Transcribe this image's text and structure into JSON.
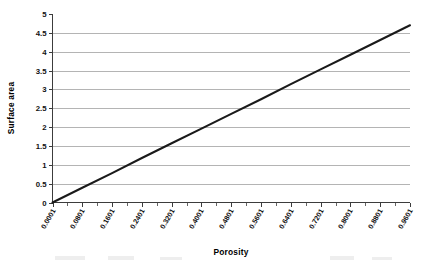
{
  "chart_data": {
    "type": "line",
    "title": "",
    "xlabel": "Porosity",
    "ylabel": "Surface area",
    "xlim": [
      0.0001,
      0.9601
    ],
    "ylim": [
      0,
      5
    ],
    "grid": true,
    "legend": "none",
    "x_tick_labels": [
      "0.0001",
      "0.0801",
      "0.1601",
      "0.2401",
      "0.3201",
      "0.4001",
      "0.4801",
      "0.5601",
      "0.6401",
      "0.7201",
      "0.8001",
      "0.8801",
      "0.9601"
    ],
    "y_tick_labels": [
      "0",
      "0.5",
      "1",
      "1.5",
      "2",
      "2.5",
      "3",
      "3.5",
      "4",
      "4.5",
      "5"
    ],
    "x": [
      0.0001,
      0.0801,
      0.1601,
      0.2401,
      0.3201,
      0.4001,
      0.4801,
      0.5601,
      0.6401,
      0.7201,
      0.8001,
      0.8801,
      0.9601
    ],
    "series": [
      {
        "name": "Surface area",
        "color": "#1a1a1a",
        "values": [
          0.0,
          0.39,
          0.78,
          1.18,
          1.57,
          1.96,
          2.35,
          2.74,
          3.14,
          3.53,
          3.92,
          4.31,
          4.7
        ]
      }
    ],
    "colors": {
      "line": "#1a1a1a",
      "grid": "#b4b4b4",
      "axis": "#3c3c3c",
      "background": "#ffffff",
      "text": "#111111"
    }
  }
}
